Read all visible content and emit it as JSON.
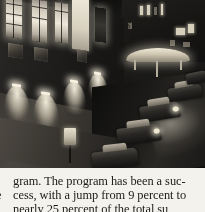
{
  "page": {
    "kind": "scanned-book-page",
    "background_color": "#f4f2ed",
    "text_color": "#1b1a18"
  },
  "photo": {
    "caption_alt": "Black-and-white night photograph of a city street: a floodlit classical stone building facade with tall bright windows and a vertical banner, a lit canopy across the street, and parked cars along the curb.",
    "banner_text": "Landscape",
    "tone": "monochrome",
    "background_color": "#0d0d0c",
    "highlight_color": "#efe9db"
  },
  "body_text": {
    "line1": "gram. The program has been a suc-",
    "line2": "cess, with a jump from 9 percent to",
    "line3": "nearly 25 percent of the total su",
    "gutter_fragment": "e"
  }
}
